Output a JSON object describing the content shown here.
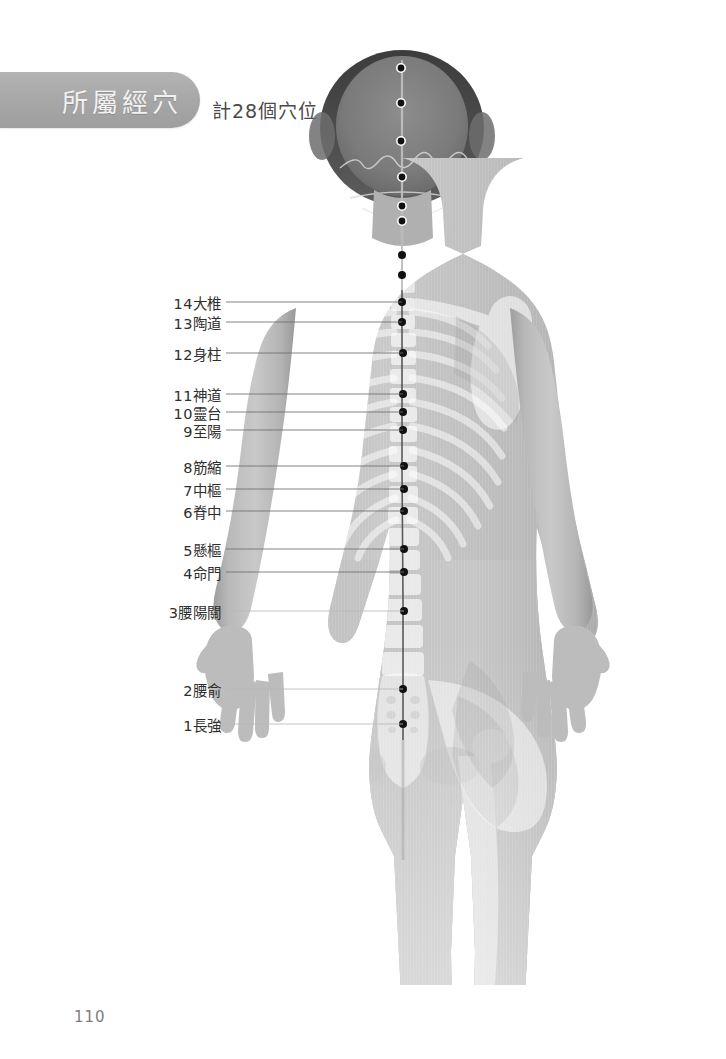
{
  "header": {
    "banner_title": "所屬經穴",
    "subtitle": "計28個穴位"
  },
  "page_number": "110",
  "figure": {
    "caption_alt": "背面人體解剖圖含骨骼透視與督脈穴位",
    "meridian_name": "督脈"
  },
  "acupoints": [
    {
      "number": "14",
      "name": "大椎",
      "label": "14大椎",
      "label_y": 302,
      "point_x": 402,
      "point_y": 302
    },
    {
      "number": "13",
      "name": "陶道",
      "label": "13陶道",
      "label_y": 322,
      "point_x": 402,
      "point_y": 322
    },
    {
      "number": "12",
      "name": "身柱",
      "label": "12身柱",
      "label_y": 353,
      "point_x": 403,
      "point_y": 353
    },
    {
      "number": "11",
      "name": "神道",
      "label": "11神道",
      "label_y": 394,
      "point_x": 403,
      "point_y": 394
    },
    {
      "number": "10",
      "name": "靈台",
      "label": "10靈台",
      "label_y": 412,
      "point_x": 403,
      "point_y": 412
    },
    {
      "number": "9",
      "name": "至陽",
      "label": "9至陽",
      "label_y": 430,
      "point_x": 403,
      "point_y": 430
    },
    {
      "number": "8",
      "name": "筋縮",
      "label": "8筋縮",
      "label_y": 466,
      "point_x": 404,
      "point_y": 466
    },
    {
      "number": "7",
      "name": "中樞",
      "label": "7中樞",
      "label_y": 489,
      "point_x": 404,
      "point_y": 489
    },
    {
      "number": "6",
      "name": "脊中",
      "label": "6脊中",
      "label_y": 511,
      "point_x": 404,
      "point_y": 511
    },
    {
      "number": "5",
      "name": "懸樞",
      "label": "5懸樞",
      "label_y": 549,
      "point_x": 404,
      "point_y": 549
    },
    {
      "number": "4",
      "name": "命門",
      "label": "4命門",
      "label_y": 572,
      "point_x": 404,
      "point_y": 572
    },
    {
      "number": "3",
      "name": "腰陽關",
      "label": "3腰陽關",
      "label_y": 611,
      "point_x": 404,
      "point_y": 611
    },
    {
      "number": "2",
      "name": "腰俞",
      "label": "2腰俞",
      "label_y": 689,
      "point_x": 403,
      "point_y": 689
    },
    {
      "number": "1",
      "name": "長強",
      "label": "1長強",
      "label_y": 724,
      "point_x": 403,
      "point_y": 724
    }
  ],
  "head_points": [
    {
      "point_x": 401,
      "point_y": 68
    },
    {
      "point_x": 401,
      "point_y": 103
    },
    {
      "point_x": 401,
      "point_y": 141
    },
    {
      "point_x": 402,
      "point_y": 177
    },
    {
      "point_x": 402,
      "point_y": 206
    },
    {
      "point_x": 402,
      "point_y": 221
    }
  ],
  "spine_points": [
    {
      "point_x": 402,
      "point_y": 255
    },
    {
      "point_x": 402,
      "point_y": 275
    }
  ],
  "colors": {
    "banner": "#a8a8a8",
    "banner_text": "#f2f2f2",
    "label_text": "#2e2e2e",
    "leader_line": "#6f6f6f",
    "point_dot": "#111111",
    "page_number": "#7d7d7d",
    "background": "#ffffff"
  }
}
